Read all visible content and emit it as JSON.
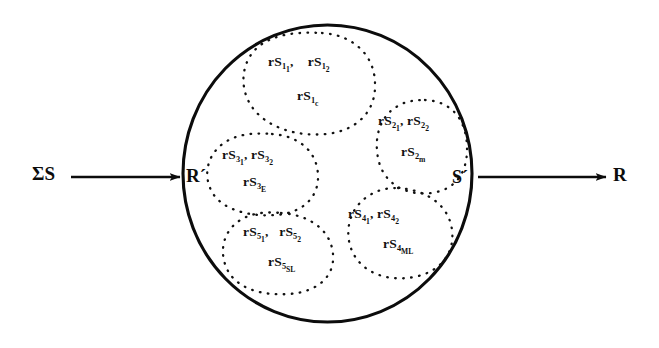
{
  "figure": {
    "type": "set-diagram",
    "stroke_color": "#0c0c0c",
    "background_color": "#ffffff"
  },
  "io": {
    "input_label": "ΣS",
    "input_boundary_label": "R´",
    "output_boundary_label": "S´",
    "output_label": "R",
    "input_arrow_name": "input-arrow",
    "output_arrow_name": "output-arrow"
  },
  "clusters": [
    {
      "id": 1,
      "suffix": "c",
      "items": [
        {
          "base": "rS",
          "sub": "1",
          "sub2": "1"
        },
        {
          "base": "rS",
          "sub": "1",
          "sub2": "2"
        },
        {
          "base": "rS",
          "sub": "1",
          "sub2": "c"
        }
      ],
      "row1": "rS₁₁,   rS₁₂",
      "row2": "rS₁c"
    },
    {
      "id": 2,
      "suffix": "m",
      "items": [
        {
          "base": "rS",
          "sub": "2",
          "sub2": "1"
        },
        {
          "base": "rS",
          "sub": "2",
          "sub2": "2"
        },
        {
          "base": "rS",
          "sub": "2",
          "sub2": "m"
        }
      ],
      "row1": "rS₂₁, rS₂₂",
      "row2": "rS₂m"
    },
    {
      "id": 3,
      "suffix": "E",
      "items": [
        {
          "base": "rS",
          "sub": "3",
          "sub2": "1"
        },
        {
          "base": "rS",
          "sub": "3",
          "sub2": "2"
        },
        {
          "base": "rS",
          "sub": "3",
          "sub2": "E"
        }
      ],
      "row1": "rS₃₁, rS₃₂",
      "row2": "rS₃E"
    },
    {
      "id": 4,
      "suffix": "ML",
      "items": [
        {
          "base": "rS",
          "sub": "4",
          "sub2": "1"
        },
        {
          "base": "rS",
          "sub": "4",
          "sub2": "2"
        },
        {
          "base": "rS",
          "sub": "4",
          "sub2": "ML"
        }
      ],
      "row1": "rS₄₁, rS₄₂",
      "row2": "rS₄ML"
    },
    {
      "id": 5,
      "suffix": "SL",
      "items": [
        {
          "base": "rS",
          "sub": "5",
          "sub2": "1"
        },
        {
          "base": "rS",
          "sub": "5",
          "sub2": "2"
        },
        {
          "base": "rS",
          "sub": "5",
          "sub2": "SL"
        }
      ],
      "row1": "rS₅₁,   rS₅₂",
      "row2": "rS₅SL"
    }
  ],
  "text_parts": {
    "base": "rS",
    "comma": ","
  }
}
